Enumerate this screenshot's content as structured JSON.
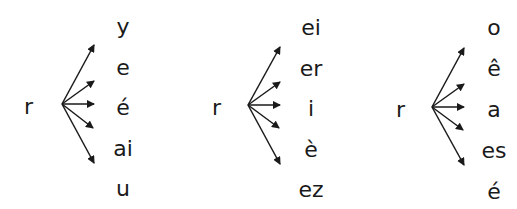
{
  "groups": [
    {
      "root": "r",
      "endings": [
        "y",
        "e",
        "é",
        "ai",
        "u"
      ]
    },
    {
      "root": "r",
      "endings": [
        "ei",
        "er",
        "i",
        "è",
        "ez"
      ]
    },
    {
      "root": "r",
      "endings": [
        "o",
        "ê",
        "a",
        "es",
        "é"
      ]
    }
  ],
  "colors": {
    "text": "#1a1a1a",
    "arrow": "#1a1a1a",
    "background": "#ffffff"
  }
}
